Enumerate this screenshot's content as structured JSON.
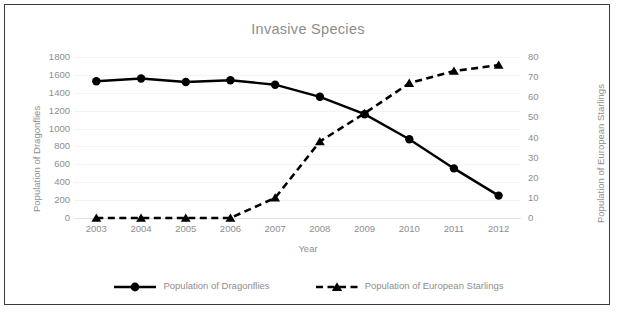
{
  "chart_data": {
    "type": "line",
    "title": "Invasive Species",
    "xlabel": "Year",
    "ylabel": "Population of Dragonflies",
    "y2label": "Population of European Starlings",
    "categories": [
      "2003",
      "2004",
      "2005",
      "2006",
      "2007",
      "2008",
      "2009",
      "2010",
      "2011",
      "2012"
    ],
    "ylim": [
      0,
      1800
    ],
    "y2lim": [
      0,
      80
    ],
    "yticks": [
      0,
      200,
      400,
      600,
      800,
      1000,
      1200,
      1400,
      1600,
      1800
    ],
    "y2ticks": [
      0,
      10,
      20,
      30,
      40,
      50,
      60,
      70,
      80
    ],
    "grid": true,
    "legend_position": "bottom",
    "series": [
      {
        "name": "Population of Dragonflies",
        "axis": "left",
        "marker": "circle",
        "linestyle": "solid",
        "color": "#000000",
        "values": [
          1530,
          1560,
          1520,
          1540,
          1490,
          1355,
          1160,
          880,
          555,
          250
        ]
      },
      {
        "name": "Population of European Starlings",
        "axis": "right",
        "marker": "triangle",
        "linestyle": "dashed",
        "color": "#000000",
        "values": [
          0,
          0,
          0,
          0,
          10,
          38,
          52,
          67,
          73,
          76
        ]
      }
    ]
  },
  "legend": {
    "items": [
      {
        "label": "Population of Dragonflies",
        "marker": "circle-marker",
        "style": "solid"
      },
      {
        "label": "Population of European Starlings",
        "marker": "triangle-marker",
        "style": "dashed"
      }
    ]
  },
  "colors": {
    "axis_text": "#8e8e8e",
    "title_text": "#8c8c8c",
    "series_ink": "#000000",
    "grid": "#f4f4f4",
    "frame": "#3a3a3a"
  }
}
